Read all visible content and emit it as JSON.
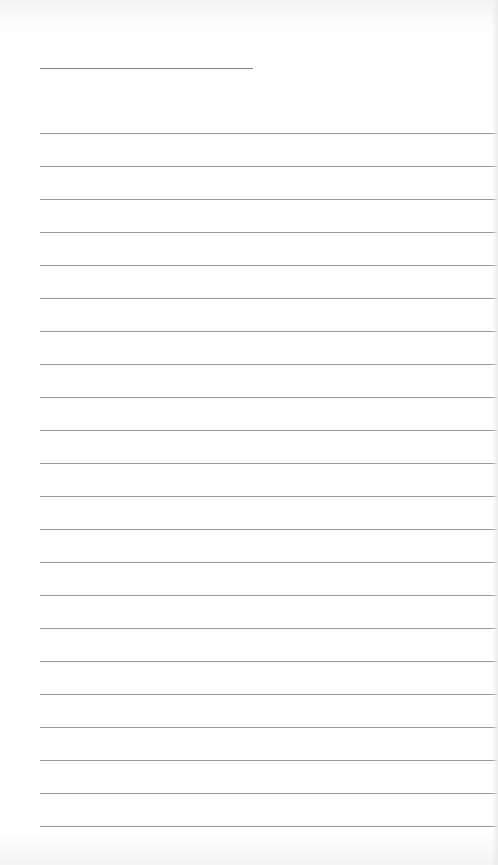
{
  "document": {
    "type": "lined-paper",
    "title_line": {
      "x": 40,
      "y": 68,
      "width": 213
    },
    "rules": {
      "count": 22,
      "start_y": 133,
      "spacing": 33,
      "left_x": 40
    },
    "colors": {
      "paper": "#ffffff",
      "line": "#9a9a9a"
    }
  }
}
